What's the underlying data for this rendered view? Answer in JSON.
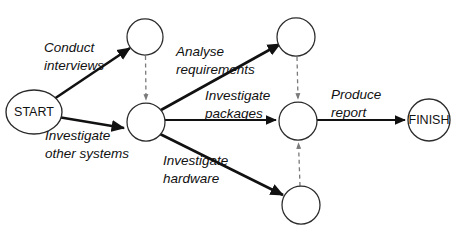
{
  "diagram": {
    "type": "activity-on-arrow-network",
    "canvas": {
      "width": 460,
      "height": 238,
      "background": "#ffffff"
    },
    "colors": {
      "node_stroke": "#2b2b2b",
      "activity_arrow": "#111111",
      "dummy_arrow": "#7a7a7a",
      "text": "#111111",
      "background": "#ffffff"
    },
    "nodes": [
      {
        "id": "start",
        "label": "START",
        "shape": "ellipse",
        "cx": 34,
        "cy": 112,
        "rx": 28,
        "ry": 22
      },
      {
        "id": "event-a",
        "label": "",
        "shape": "circle",
        "cx": 145,
        "cy": 37,
        "rx": 18,
        "ry": 18
      },
      {
        "id": "event-b",
        "label": "",
        "shape": "circle",
        "cx": 146,
        "cy": 122,
        "rx": 19,
        "ry": 19
      },
      {
        "id": "event-c",
        "label": "",
        "shape": "circle",
        "cx": 296,
        "cy": 37,
        "rx": 19,
        "ry": 19
      },
      {
        "id": "event-d",
        "label": "",
        "shape": "circle",
        "cx": 298,
        "cy": 121,
        "rx": 19,
        "ry": 19
      },
      {
        "id": "event-e",
        "label": "",
        "shape": "circle",
        "cx": 301,
        "cy": 205,
        "rx": 19,
        "ry": 19
      },
      {
        "id": "finish",
        "label": "FINISH",
        "shape": "circle",
        "cx": 429,
        "cy": 120,
        "rx": 21,
        "ry": 21
      }
    ],
    "activities": [
      {
        "id": "conduct-interviews",
        "label_lines": [
          "Conduct",
          "interviews"
        ],
        "from": "start",
        "to": "event-a",
        "style": "solid"
      },
      {
        "id": "investigate-other-systems",
        "label_lines": [
          "Investigate",
          "other systems"
        ],
        "from": "start",
        "to": "event-b",
        "style": "solid"
      },
      {
        "id": "analyse-requirements",
        "label_lines": [
          "Analyse",
          "requirements"
        ],
        "from": "event-b",
        "to": "event-c",
        "style": "solid"
      },
      {
        "id": "investigate-packages",
        "label_lines": [
          "Investigate",
          "packages"
        ],
        "from": "event-b",
        "to": "event-d",
        "style": "solid"
      },
      {
        "id": "investigate-hardware",
        "label_lines": [
          "Investigate",
          "hardware"
        ],
        "from": "event-b",
        "to": "event-e",
        "style": "solid"
      },
      {
        "id": "produce-report",
        "label_lines": [
          "Produce",
          "report"
        ],
        "from": "event-d",
        "to": "finish",
        "style": "solid"
      }
    ],
    "dummy_activities": [
      {
        "id": "dummy-a-to-b",
        "from": "event-a",
        "to": "event-b",
        "style": "dashed",
        "label": ""
      },
      {
        "id": "dummy-c-to-d",
        "from": "event-c",
        "to": "event-d",
        "style": "dashed",
        "label": ""
      },
      {
        "id": "dummy-e-to-d",
        "from": "event-e",
        "to": "event-d",
        "style": "dashed",
        "label": ""
      }
    ],
    "labels": {
      "start": "START",
      "finish": "FINISH",
      "conduct_interviews_l1": "Conduct",
      "conduct_interviews_l2": "interviews",
      "investigate_other_systems_l1": "Investigate",
      "investigate_other_systems_l2": "other systems",
      "analyse_requirements_l1": "Analyse",
      "analyse_requirements_l2": "requirements",
      "investigate_packages_l1": "Investigate",
      "investigate_packages_l2": "packages",
      "investigate_hardware_l1": "Investigate",
      "investigate_hardware_l2": "hardware",
      "produce_report_l1": "Produce",
      "produce_report_l2": "report"
    }
  }
}
